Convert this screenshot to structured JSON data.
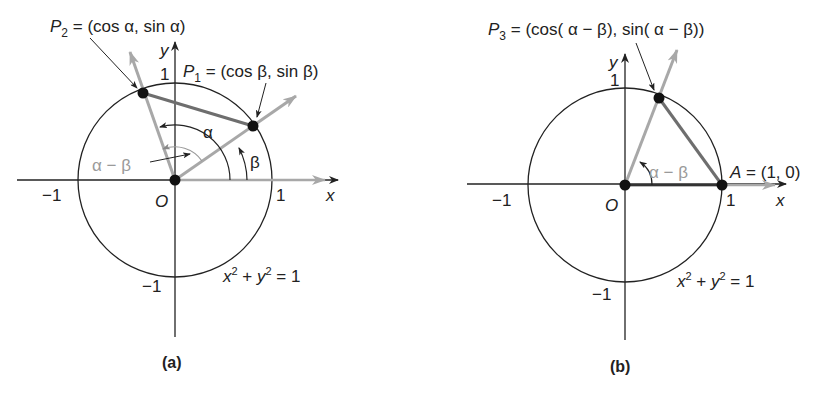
{
  "panels": [
    {
      "id": "a",
      "caption": "(a)",
      "circle_equation": "x² + y² = 1",
      "axis_labels": {
        "x": "x",
        "y": "y"
      },
      "ticks": {
        "x_neg": "−1",
        "x_pos": "1",
        "y_pos": "1",
        "y_neg": "−1",
        "origin": "O"
      },
      "points": [
        {
          "name": "P2",
          "label": "P₂ = (cos α, sin α)"
        },
        {
          "name": "P1",
          "label": "P₁ = (cos β, sin β)"
        }
      ],
      "angles": {
        "alpha": "α",
        "beta": "β",
        "alpha_minus_beta": "α − β"
      },
      "labels": {
        "p2_main": "P",
        "p2_sub": "2",
        "p2_rest": " = (cos α, sin α)",
        "p1_main": "P",
        "p1_sub": "1",
        "p1_rest": " = (cos β, sin β)",
        "eq_x": "x",
        "eq_plus": " + ",
        "eq_y": "y",
        "eq_rest": " = 1",
        "sup2": "2"
      }
    },
    {
      "id": "b",
      "caption": "(b)",
      "circle_equation": "x² + y² = 1",
      "axis_labels": {
        "x": "x",
        "y": "y"
      },
      "ticks": {
        "x_neg": "−1",
        "x_pos": "1",
        "y_pos": "1",
        "y_neg": "−1",
        "origin": "O"
      },
      "points": [
        {
          "name": "P3",
          "label": "P₃ = (cos( α − β), sin( α − β))"
        },
        {
          "name": "A",
          "label": "A = (1, 0)"
        }
      ],
      "angles": {
        "alpha_minus_beta": "α − β"
      },
      "labels": {
        "p3_main": "P",
        "p3_sub": "3",
        "p3_rest": " = (cos( α − β), sin( α − β))",
        "a_main": "A",
        "a_rest": " = (1, 0)",
        "eq_x": "x",
        "eq_plus": " + ",
        "eq_y": "y",
        "eq_rest": " = 1",
        "sup2": "2"
      }
    }
  ],
  "colors": {
    "line": "#222222",
    "ray": "#a8a8a8",
    "chord": "#6e6e6e",
    "point": "#111111"
  }
}
